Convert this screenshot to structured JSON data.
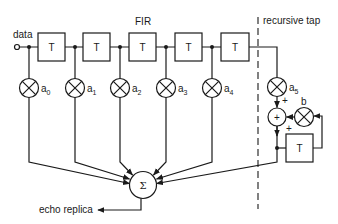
{
  "labels": {
    "fir": "FIR",
    "recursive": "recursive tap",
    "input": "data",
    "output": "echo replica"
  },
  "fir_delays": [
    {
      "label": "T"
    },
    {
      "label": "T"
    },
    {
      "label": "T"
    },
    {
      "label": "T"
    },
    {
      "label": "T"
    }
  ],
  "fir_taps": [
    {
      "coef": "a",
      "sub": "0"
    },
    {
      "coef": "a",
      "sub": "1"
    },
    {
      "coef": "a",
      "sub": "2"
    },
    {
      "coef": "a",
      "sub": "3"
    },
    {
      "coef": "a",
      "sub": "4"
    }
  ],
  "recursive": {
    "tap": {
      "coef": "a",
      "sub": "5"
    },
    "feedback_coef": "b",
    "adder_symbol": "+",
    "adder_signs": [
      "+",
      "+"
    ],
    "delay_label": "T"
  },
  "summer": {
    "symbol": "Σ"
  },
  "colors": {
    "line": "#1a1a1a",
    "background": "#ffffff"
  }
}
